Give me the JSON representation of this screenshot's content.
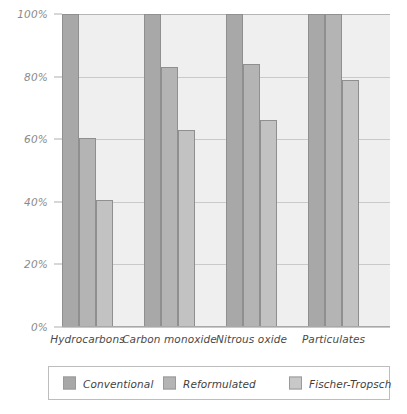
{
  "chart_data": {
    "type": "bar",
    "title": "",
    "subtitle": "",
    "xlabel": "",
    "ylabel": "",
    "ylim": [
      0,
      100
    ],
    "y_unit": "%",
    "grid": true,
    "legend_position": "bottom",
    "categories": [
      "Hydrocarbons",
      "Carbon monoxide",
      "Nitrous oxide",
      "Particulates"
    ],
    "y_ticks": [
      0,
      20,
      40,
      60,
      80,
      100
    ],
    "y_tick_labels": [
      "0%",
      "20%",
      "40%",
      "60%",
      "80%",
      "100%"
    ],
    "series": [
      {
        "name": "Conventional",
        "color": "#a8a8a8",
        "values": [
          100,
          100,
          100,
          100
        ]
      },
      {
        "name": "Reformulated",
        "color": "#b4b4b4",
        "values": [
          60.5,
          83,
          84,
          100
        ]
      },
      {
        "name": "Fischer-Tropsch",
        "color": "#c8c8c8",
        "values": [
          40.5,
          63,
          66,
          79
        ]
      }
    ]
  },
  "legend": {
    "items": [
      {
        "label": "Conventional"
      },
      {
        "label": "Reformulated"
      },
      {
        "label": "Fischer-Tropsch"
      }
    ]
  },
  "colors": {
    "plot_background": "#efefef",
    "gridline": "#c9c9c9",
    "axis_text": "#8a8a8a",
    "category_text": "#4a4a4a",
    "legend_border": "#bdbdbd"
  }
}
